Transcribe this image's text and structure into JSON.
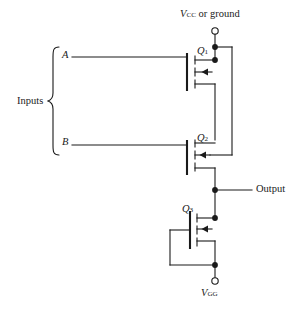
{
  "figure": {
    "kind": "mosfet-logic-schematic",
    "background_color": "#ffffff",
    "line_color": "#1a1a1a"
  },
  "labels": {
    "rail": {
      "prefix": "V",
      "subscript": "CC",
      "suffix": " or ground"
    },
    "supply_bottom": {
      "prefix": "V",
      "subscript": "GG"
    },
    "inputs_group": "Inputs",
    "input_a": "A",
    "input_b": "B",
    "output": "Output"
  },
  "transistors": [
    {
      "id": "q1",
      "prefix": "Q",
      "subscript": "1",
      "orientation": "gate-left"
    },
    {
      "id": "q2",
      "prefix": "Q",
      "subscript": "2",
      "orientation": "gate-left"
    },
    {
      "id": "q3",
      "prefix": "Q",
      "subscript": "3",
      "orientation": "gate-right"
    }
  ],
  "nodes": [
    {
      "name": "rail-node",
      "x": 215,
      "y": 47
    },
    {
      "name": "q1-drain-node",
      "x": 215,
      "y": 60
    },
    {
      "name": "output-node",
      "x": 215,
      "y": 190
    },
    {
      "name": "q3-drain-node",
      "x": 215,
      "y": 218
    },
    {
      "name": "vgg-node",
      "x": 215,
      "y": 265
    }
  ],
  "terminals": [
    {
      "name": "rail-terminal",
      "x": 215,
      "y": 31,
      "radius": 3.2
    },
    {
      "name": "vgg-terminal",
      "x": 215,
      "y": 281,
      "radius": 3.2
    }
  ]
}
